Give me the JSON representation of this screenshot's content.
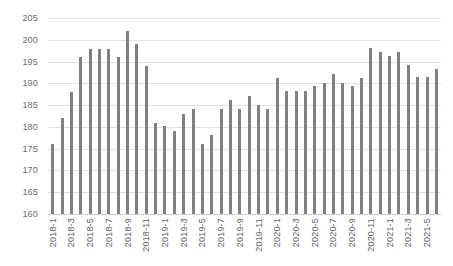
{
  "chart_data": {
    "type": "bar",
    "title": "",
    "subtitle": "",
    "xlabel": "",
    "ylabel": "",
    "ylim": [
      160,
      205
    ],
    "ytick_step": 5,
    "yticks": [
      160,
      165,
      170,
      175,
      180,
      185,
      190,
      195,
      200,
      205
    ],
    "ytick_labels": [
      "160",
      "165",
      "170",
      "175",
      "180",
      "185",
      "190",
      "195",
      "200",
      "205"
    ],
    "grid": true,
    "legend": false,
    "legend_position": "none",
    "bar_color": "#808080",
    "gridline_color": "#e2e2e2",
    "axis_text_color": "#6b6b6b",
    "background_color": "#ffffff",
    "xtick_label_interval": 2,
    "categories": [
      "2018-1",
      "2018-2",
      "2018-3",
      "2018-4",
      "2018-5",
      "2018-6",
      "2018-7",
      "2018-8",
      "2018-9",
      "2018-10",
      "2018-11",
      "2018-12",
      "2019-1",
      "2019-2",
      "2019-3",
      "2019-4",
      "2019-5",
      "2019-6",
      "2019-7",
      "2019-8",
      "2019-9",
      "2019-10",
      "2019-11",
      "2019-12",
      "2020-1",
      "2020-2",
      "2020-3",
      "2020-4",
      "2020-5",
      "2020-6",
      "2020-7",
      "2020-8",
      "2020-9",
      "2020-10",
      "2020-11",
      "2020-12",
      "2021-1",
      "2021-2",
      "2021-3",
      "2021-4",
      "2021-5",
      "2021-6"
    ],
    "values": [
      176.0,
      182.0,
      188.0,
      196.0,
      198.0,
      198.0,
      198.0,
      196.0,
      202.0,
      199.0,
      194.0,
      181.0,
      180.1,
      179.1,
      183.0,
      184.1,
      176.1,
      178.1,
      184.1,
      186.1,
      184.1,
      187.1,
      185.1,
      184.2,
      191.2,
      188.2,
      188.2,
      188.2,
      189.3,
      190.1,
      192.2,
      190.1,
      189.3,
      191.3,
      198.2,
      197.2,
      196.2,
      197.3,
      194.2,
      191.5,
      191.5,
      193.4
    ],
    "xtick_labels": [
      "2018-1",
      "2018-3",
      "2018-5",
      "2018-7",
      "2018-9",
      "2018-11",
      "2019-1",
      "2019-3",
      "2019-5",
      "2019-7",
      "2019-9",
      "2019-11",
      "2020-1",
      "2020-3",
      "2020-5",
      "2020-7",
      "2020-9",
      "2020-11",
      "2021-1",
      "2021-3",
      "2021-5"
    ]
  }
}
